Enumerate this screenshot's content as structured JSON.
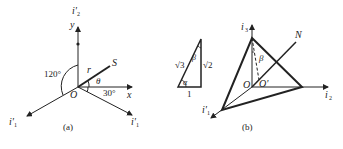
{
  "figure_a": {
    "caption": "(a)",
    "axis_up_label": "i'",
    "axis_up_sub": "2",
    "y_label": "y",
    "x_label": "x",
    "axis_left_label": "i'",
    "axis_left_sub": "1",
    "axis_right_label": "i'",
    "axis_right_sub": "1",
    "origin_label": "O",
    "vector_label": "S",
    "radius_label": "r",
    "theta_label": "θ",
    "angle_120": "120°",
    "angle_30": "30°"
  },
  "triangle": {
    "hyp_label": "√3",
    "right_label": "√2",
    "bottom_label": "1",
    "alpha_label": "α",
    "beta_label": "β"
  },
  "figure_b": {
    "caption": "(b)",
    "axis_top_label": "i",
    "axis_top_sub": "3",
    "axis_right_label": "i",
    "axis_right_sub": "2",
    "axis_left_label": "i'",
    "axis_left_sub": "1",
    "origin_label": "O",
    "origin_prime_label": "O'",
    "normal_label": "N",
    "beta_label": "β"
  }
}
